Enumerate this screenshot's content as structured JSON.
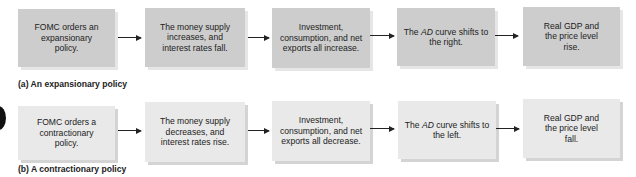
{
  "diagram": {
    "type": "flowchart",
    "rows": [
      {
        "id": "a",
        "caption": "(a) An expansionary policy",
        "box_color": "#cdcdcd",
        "steps": [
          {
            "pre": "FOMC orders an expansionary policy.",
            "em": "",
            "post": ""
          },
          {
            "pre": "The money supply increases, and interest rates fall.",
            "em": "",
            "post": ""
          },
          {
            "pre": "Investment, consumption, and net exports all increase.",
            "em": "",
            "post": ""
          },
          {
            "pre": "The ",
            "em": "AD",
            "post": " curve shifts to the right."
          },
          {
            "pre": "Real GDP and the price level rise.",
            "em": "",
            "post": ""
          }
        ]
      },
      {
        "id": "b",
        "caption": "(b) A contractionary policy",
        "box_color": "#e9e9e9",
        "steps": [
          {
            "pre": "FOMC orders a contractionary policy.",
            "em": "",
            "post": ""
          },
          {
            "pre": "The money supply decreases, and interest rates rise.",
            "em": "",
            "post": ""
          },
          {
            "pre": "Investment, consumption, and net exports all decrease.",
            "em": "",
            "post": ""
          },
          {
            "pre": "The ",
            "em": "AD",
            "post": " curve shifts to the left."
          },
          {
            "pre": "Real GDP and the price level fall.",
            "em": "",
            "post": ""
          }
        ]
      }
    ],
    "connector": "arrow-right"
  }
}
